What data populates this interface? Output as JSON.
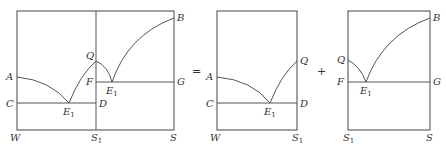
{
  "figure": {
    "type": "phase-diagram-decomposition",
    "operators": {
      "equals": "=",
      "plus": "+"
    },
    "panels": [
      {
        "id": "combined",
        "labels": {
          "A": "A",
          "B": "B",
          "C": "C",
          "D": "D",
          "F": "F",
          "G": "G",
          "Q": "Q",
          "E1_left": "E",
          "E1_left_sub": "1",
          "E1_right": "E",
          "E1_right_sub": "1",
          "W": "W",
          "S1": "S",
          "S1_sub": "1",
          "S": "S"
        }
      },
      {
        "id": "left-subsystem",
        "labels": {
          "A": "A",
          "C": "C",
          "D": "D",
          "Q": "Q",
          "E1": "E",
          "E1_sub": "1",
          "W": "W",
          "S1": "S",
          "S1_sub": "1"
        }
      },
      {
        "id": "right-subsystem",
        "labels": {
          "B": "B",
          "F": "F",
          "G": "G",
          "Q": "Q",
          "E1": "E",
          "E1_sub": "1",
          "S1": "S",
          "S1_sub": "1",
          "S": "S"
        }
      }
    ]
  }
}
